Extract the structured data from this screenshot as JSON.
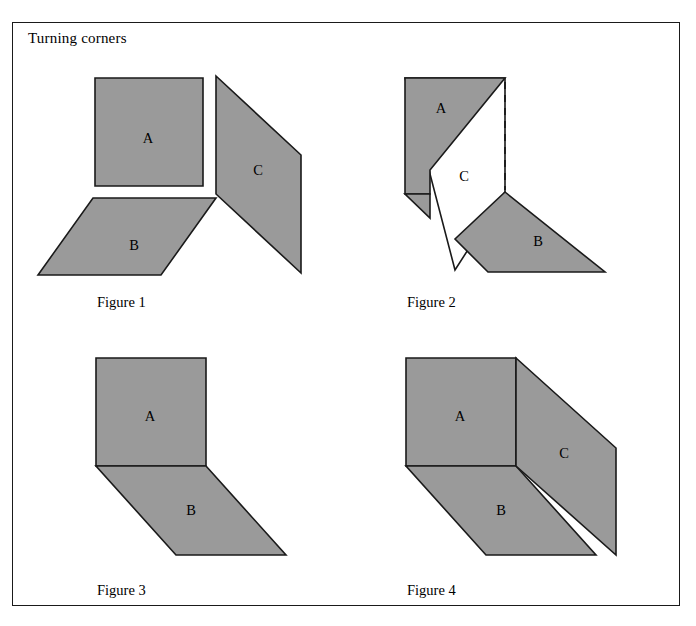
{
  "title": "Turning corners",
  "style": {
    "panel_fill": "#9a9a9a",
    "panel_stroke": "#1a1a1a",
    "white_fill": "#ffffff",
    "frame_stroke": "#1a1a1a",
    "background": "#ffffff"
  },
  "panel_labels": {
    "a": "A",
    "b": "B",
    "c": "C"
  },
  "figures": [
    {
      "id": "figure-1",
      "caption": "Figure 1",
      "description": "Three separate flat panels A, B and C shown apart before folding",
      "panels": [
        {
          "name": "A",
          "fill": "grey",
          "points": "95,78 203,78 203,186 95,186",
          "label_x": 148,
          "label_y": 140
        },
        {
          "name": "B",
          "fill": "grey",
          "points": "93,198 216,198 161,275 38,275",
          "label_x": 134,
          "label_y": 247
        },
        {
          "name": "C",
          "fill": "grey",
          "points": "216,76 301,155 301,273 216,194",
          "label_x": 258,
          "label_y": 172
        }
      ],
      "dashed_lines": []
    },
    {
      "id": "figure-2",
      "caption": "Figure 2",
      "description": "Panels partially folded, panel C seen edge-on in white with a dashed fold line",
      "panels": [
        {
          "name": "C",
          "fill": "white",
          "points": "405,78 505,78 505,192 455,270",
          "label_x": 464,
          "label_y": 178
        },
        {
          "name": "A",
          "fill": "grey",
          "points": "405,78 505,78 430,170 430,194 405,194",
          "label_x": 441,
          "label_y": 110
        },
        {
          "name": "A-flap",
          "fill": "grey",
          "points": "405,194 430,194 430,218",
          "label_x": null,
          "label_y": null
        },
        {
          "name": "B",
          "fill": "grey",
          "points": "505,192 605,272 488,272 455,239",
          "label_x": 538,
          "label_y": 243
        }
      ],
      "dashed_lines": [
        {
          "x1": 505,
          "y1": 82,
          "x2": 505,
          "y2": 190
        }
      ]
    },
    {
      "id": "figure-3",
      "caption": "Figure 3",
      "description": "Panels A and B joined along a shared fold edge forming a two-panel bend",
      "panels": [
        {
          "name": "A",
          "fill": "grey",
          "points": "96,358 206,358 206,466 96,466",
          "label_x": 150,
          "label_y": 418
        },
        {
          "name": "B",
          "fill": "grey",
          "points": "96,466 206,466 286,555 176,555",
          "label_x": 191,
          "label_y": 512
        }
      ],
      "dashed_lines": []
    },
    {
      "id": "figure-4",
      "caption": "Figure 4",
      "description": "All three panels A, B and C joined to form a complete corner",
      "panels": [
        {
          "name": "A",
          "fill": "grey",
          "points": "406,358 516,358 516,466 406,466",
          "label_x": 460,
          "label_y": 418
        },
        {
          "name": "B",
          "fill": "grey",
          "points": "406,466 516,466 596,555 486,555",
          "label_x": 501,
          "label_y": 512
        },
        {
          "name": "C",
          "fill": "grey",
          "points": "516,358 616,448 616,555 516,466",
          "label_x": 564,
          "label_y": 455
        }
      ],
      "dashed_lines": []
    }
  ]
}
